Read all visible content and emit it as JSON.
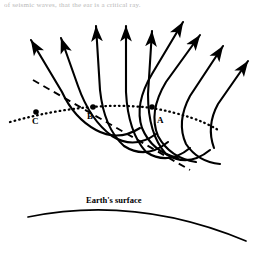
{
  "figure": {
    "type": "seismic-ray-path-diagram",
    "caption_fragment": "of seismic waves, that the ear is a critical ray.",
    "labels": {
      "point_a": "A",
      "point_b": "B",
      "point_c": "C",
      "earth_surface": "Earth's surface"
    },
    "colors": {
      "ink": "#000000",
      "background": "#ffffff",
      "faded_text": "#b9b9b9"
    },
    "points": [
      {
        "name": "C",
        "x": 36,
        "y": 112,
        "label_x": 32,
        "label_y": 119
      },
      {
        "name": "B",
        "x": 93,
        "y": 108,
        "label_x": 88,
        "label_y": 115
      },
      {
        "name": "A",
        "x": 152,
        "y": 108,
        "label_x": 158,
        "label_y": 117
      }
    ],
    "dotted_line": {
      "style": "dotted",
      "path": "M 10 122 Q 90 100 152 108 Q 195 116 218 130"
    },
    "dashed_line": {
      "style": "dashed",
      "path": "M 33 80 L 190 170"
    },
    "earth_surface_arc": {
      "path": "M 28 217 Q 135 196 246 241",
      "label_x": 85,
      "label_y": 199
    },
    "rays": [
      {
        "id": "ray-1",
        "path": "M 30 40 L 62 92 Q 74 118 96 130 Q 118 142 140 128",
        "arrow_tip": [
          28,
          35
        ],
        "arrow_angle": -121
      },
      {
        "id": "ray-2",
        "path": "M 60 38 L 78 86 Q 90 120 112 136 Q 134 150 156 134",
        "arrow_tip": [
          58,
          33
        ],
        "arrow_angle": -111
      },
      {
        "id": "ray-3",
        "path": "M 96 26 L 100 90 Q 104 128 124 146 Q 146 160 168 142",
        "arrow_tip": [
          96,
          21
        ],
        "arrow_angle": -92
      },
      {
        "id": "ray-4",
        "path": "M 126 26 L 126 92 Q 128 132 146 152 Q 168 166 190 148",
        "arrow_tip": [
          126,
          21
        ],
        "arrow_angle": -90
      },
      {
        "id": "ray-5",
        "path": "M 152 31 L 148 94 Q 148 134 166 154 Q 188 168 210 150",
        "arrow_tip": [
          152,
          26
        ],
        "arrow_angle": -86
      },
      {
        "id": "ray-6",
        "path": "M 184 21 L 152 74 Q 134 104 142 128 Q 152 152 178 158",
        "arrow_tip": [
          185,
          16
        ],
        "arrow_angle": -58
      },
      {
        "id": "ray-7",
        "path": "M 201 34 L 166 82 Q 148 112 158 136 Q 170 158 196 162",
        "arrow_tip": [
          202,
          29
        ],
        "arrow_angle": -54
      },
      {
        "id": "ray-8",
        "path": "M 224 45 L 190 96 Q 176 122 186 144 Q 198 162 220 164",
        "arrow_tip": [
          225,
          40
        ],
        "arrow_angle": -56
      },
      {
        "id": "ray-9",
        "path": "M 249 60 L 218 104 Q 206 126 214 146",
        "arrow_tip": [
          250,
          55
        ],
        "arrow_angle": -55
      }
    ]
  }
}
